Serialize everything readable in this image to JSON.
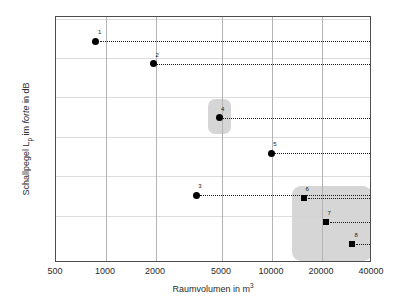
{
  "chart_data": {
    "type": "scatter",
    "title": "",
    "xlabel": "Raumvolumen in m",
    "xlabel_exponent": "3",
    "ylabel_main": "Schallpegel L",
    "ylabel_sub": "p",
    "ylabel_mid": " im ",
    "ylabel_italic": "forte",
    "ylabel_end": " in dB",
    "xscale": "log",
    "yscale": "linear",
    "xlim": [
      500,
      40000
    ],
    "ylim": [
      82,
      97.6
    ],
    "grid": "both",
    "legend": "none",
    "xticks": [
      500,
      1000,
      2000,
      5000,
      10000,
      20000,
      40000
    ],
    "xticklabels": [
      "500",
      "1000",
      "2000",
      "5000",
      "10000",
      "20000",
      "40000"
    ],
    "yticks_major": [
      85,
      90,
      95
    ],
    "yticklabels": [
      "85",
      "90",
      "95"
    ],
    "yticks_minor": [
      87.5,
      92.5,
      97.5,
      83.5
    ],
    "hgridlines": [
      85,
      87.5,
      90,
      92.5,
      95,
      97.5
    ],
    "points": [
      {
        "label": "1",
        "x": 870,
        "y": 96.05,
        "marker": "circle",
        "line_to": 40000
      },
      {
        "label": "2",
        "x": 1930,
        "y": 94.65,
        "marker": "circle",
        "line_to": 40000
      },
      {
        "label": "3",
        "x": 3500,
        "y": 86.3,
        "marker": "circle",
        "line_to": 40000
      },
      {
        "label": "4",
        "x": 4800,
        "y": 91.2,
        "marker": "circle",
        "line_to": 40000
      },
      {
        "label": "5",
        "x": 9900,
        "y": 88.95,
        "marker": "circle",
        "line_to": 40000
      },
      {
        "label": "6",
        "x": 15500,
        "y": 86.15,
        "marker": "square",
        "line_to": 40000
      },
      {
        "label": "7",
        "x": 21000,
        "y": 84.6,
        "marker": "square",
        "line_to": 40000
      },
      {
        "label": "8",
        "x": 30500,
        "y": 83.2,
        "marker": "square",
        "line_to": 40000
      }
    ],
    "highlights": [
      {
        "name": "highlight-point-4",
        "x0": 4100,
        "x1": 5700,
        "y0": 90.2,
        "y1": 92.4,
        "color": "#d2d2d2"
      },
      {
        "name": "highlight-points-6-7-8",
        "x0": 13200,
        "x1": 40000,
        "y0": 82.1,
        "y1": 86.9,
        "color": "#d2d2d2"
      }
    ],
    "colors": {
      "marker": "#000000",
      "frame": "#4d4d4d",
      "vgrid": "#b4b4b4",
      "hgrid": "#dcdcdc",
      "highlight": "#d2d2d2",
      "text": "#2b2b2b",
      "background": "#ffffff"
    }
  }
}
